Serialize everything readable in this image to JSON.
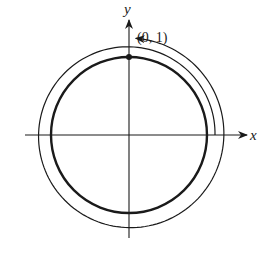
{
  "diagram": {
    "type": "unit-circle-winding",
    "colors": {
      "background": "#ffffff",
      "stroke": "#1a1a1a"
    },
    "origin": {
      "px": 129,
      "py": 135
    },
    "axes": {
      "x": {
        "label": "x",
        "from": 25,
        "to": 247,
        "label_pos": [
          250,
          140
        ]
      },
      "y": {
        "label": "y",
        "from": 238,
        "to": 20,
        "label_pos": [
          124,
          14
        ]
      }
    },
    "unit_circle": {
      "radius_px": 78,
      "stroke_width": 2.4
    },
    "point": {
      "label": "(0, 1)",
      "coords": [
        0,
        1
      ],
      "label_pos": [
        137,
        42
      ]
    },
    "spiral": {
      "description": "Counterclockwise wrapping path, 1.25 turns starting on positive x-axis, ending with arrow at positive y-axis",
      "start_angle_deg": 0,
      "end_angle_deg": 450,
      "start_radius_px": 86,
      "end_radius_px": 97,
      "direction": "counterclockwise",
      "stroke_width": 1.2
    }
  }
}
